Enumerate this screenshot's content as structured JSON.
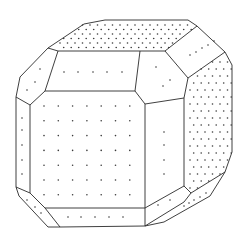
{
  "caption": {
    "text": "",
    "note": "partially cropped line of text at top edge, illegible"
  },
  "diagram": {
    "title": "",
    "colors": {
      "edge": "#2a2a2a",
      "dot": "#3a3a3a",
      "background": "#ffffff"
    },
    "faces": [
      {
        "id": "front-square",
        "points": [
          [
            48,
            92
          ],
          [
            135,
            92
          ],
          [
            160,
            110
          ],
          [
            160,
            207
          ],
          [
            135,
            208
          ],
          [
            48,
            208
          ],
          [
            48,
            92
          ]
        ],
        "dot_grid": {
          "x0": 43,
          "dx": 14.2,
          "y0": 108,
          "dy": 14.5,
          "cols": 7,
          "rows": 7
        }
      },
      {
        "id": "top-band",
        "points": [
          [
            58,
            51
          ],
          [
            165,
            51
          ],
          [
            168,
            68
          ],
          [
            155,
            80
          ],
          [
            135,
            92
          ],
          [
            45,
            91
          ],
          [
            58,
            51
          ]
        ],
        "dots": [
          [
            64,
            72
          ],
          [
            79,
            72
          ],
          [
            93,
            72
          ],
          [
            107,
            72
          ],
          [
            122,
            72
          ]
        ]
      },
      {
        "id": "top-face",
        "points": [
          [
            84,
            24
          ],
          [
            105,
            20
          ],
          [
            188,
            20
          ],
          [
            197,
            26
          ],
          [
            163,
            45
          ],
          [
            140,
            51
          ],
          [
            58,
            51
          ],
          [
            48,
            48
          ],
          [
            84,
            24
          ]
        ]
      },
      {
        "id": "top-right-bevel",
        "points": [
          [
            197,
            26
          ],
          [
            225,
            52
          ],
          [
            188,
            78
          ],
          [
            163,
            45
          ],
          [
            197,
            26
          ]
        ]
      },
      {
        "id": "right-upper-band",
        "points": [
          [
            163,
            45
          ],
          [
            188,
            78
          ],
          [
            181,
            98
          ],
          [
            145,
            104
          ],
          [
            135,
            92
          ],
          [
            155,
            80
          ],
          [
            168,
            68
          ],
          [
            163,
            45
          ]
        ]
      },
      {
        "id": "right-face",
        "points": [
          [
            188,
            78
          ],
          [
            225,
            52
          ],
          [
            232,
            65
          ],
          [
            232,
            152
          ],
          [
            225,
            172
          ],
          [
            192,
            187
          ],
          [
            184,
            186
          ],
          [
            184,
            98
          ],
          [
            188,
            78
          ]
        ]
      },
      {
        "id": "right-lower-band",
        "points": [
          [
            145,
            104
          ],
          [
            181,
            98
          ],
          [
            184,
            98
          ],
          [
            184,
            186
          ],
          [
            160,
            194
          ],
          [
            160,
            110
          ],
          [
            145,
            104
          ]
        ]
      },
      {
        "id": "left-upper-bevel",
        "points": [
          [
            48,
            48
          ],
          [
            58,
            51
          ],
          [
            45,
            91
          ],
          [
            30,
            105
          ],
          [
            16,
            97
          ],
          [
            20,
            77
          ],
          [
            48,
            48
          ]
        ]
      },
      {
        "id": "left-face",
        "points": [
          [
            16,
            97
          ],
          [
            30,
            105
          ],
          [
            30,
            193
          ],
          [
            16,
            187
          ],
          [
            16,
            97
          ]
        ]
      },
      {
        "id": "lower-left-bevel",
        "points": [
          [
            16,
            187
          ],
          [
            30,
            193
          ],
          [
            45,
            208
          ],
          [
            60,
            227
          ],
          [
            48,
            227
          ],
          [
            19,
            196
          ],
          [
            16,
            187
          ]
        ]
      },
      {
        "id": "bottom-band",
        "points": [
          [
            45,
            208
          ],
          [
            145,
            208
          ],
          [
            145,
            226
          ],
          [
            60,
            227
          ],
          [
            45,
            208
          ]
        ]
      },
      {
        "id": "bottom-right-face",
        "points": [
          [
            135,
            208
          ],
          [
            160,
            194
          ],
          [
            184,
            186
          ],
          [
            191,
            193
          ],
          [
            164,
            222
          ],
          [
            145,
            226
          ],
          [
            145,
            208
          ],
          [
            135,
            208
          ]
        ]
      },
      {
        "id": "lower-right-bevel",
        "points": [
          [
            191,
            193
          ],
          [
            225,
            172
          ],
          [
            210,
            196
          ],
          [
            164,
            222
          ],
          [
            191,
            193
          ]
        ]
      }
    ]
  }
}
